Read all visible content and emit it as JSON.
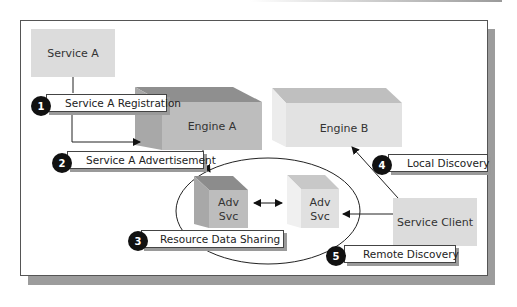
{
  "diagram": {
    "nodes": {
      "service_a": {
        "label": "Service A"
      },
      "engine_a": {
        "label": "Engine A"
      },
      "engine_b": {
        "label": "Engine B"
      },
      "adv_svc_a": {
        "line1": "Adv",
        "line2": "Svc"
      },
      "adv_svc_b": {
        "line1": "Adv",
        "line2": "Svc"
      },
      "service_client": {
        "label": "Service Client"
      }
    },
    "steps": [
      {
        "number": "1",
        "label": "Service A Registration"
      },
      {
        "number": "2",
        "label": "Service A Advertisement"
      },
      {
        "number": "3",
        "label": "Resource Data Sharing"
      },
      {
        "number": "4",
        "label": "Local Discovery"
      },
      {
        "number": "5",
        "label": "Remote Discovery"
      }
    ],
    "colors": {
      "engine_a_front": "#bdbdbd",
      "engine_b_front": "#e2e2e2",
      "flat_box": "#dcdcdc",
      "badge": "#111111"
    }
  }
}
